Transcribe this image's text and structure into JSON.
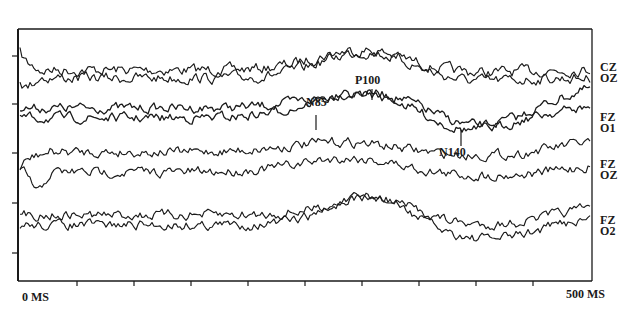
{
  "chart_data": {
    "type": "line",
    "title": "",
    "xlabel": "",
    "ylabel": "",
    "x_range_ms": [
      0,
      500
    ],
    "x_tick_labels": {
      "start": "0 MS",
      "end": "500 MS"
    },
    "x_ticks_ms": [
      0,
      50,
      100,
      150,
      200,
      250,
      300,
      350,
      400,
      450,
      500
    ],
    "y_ticks_count": 5,
    "grid": false,
    "legend_position": "right",
    "pairs": [
      {
        "labels": [
          "CZ",
          "OZ"
        ],
        "baseline_y_px": 70,
        "features": "broad positive hump near ~200-215 ms, otherwise noisy flat"
      },
      {
        "labels": [
          "FZ",
          "O1"
        ],
        "baseline_y_px": 112,
        "features": "negative N85 near 160 ms, positive peak P100 near ~215 ms, negative N140 near ~285 ms",
        "annotations": [
          {
            "text": "N85",
            "x_ms": 157,
            "kind": "negative"
          },
          {
            "text": "P100",
            "x_ms": 215,
            "kind": "positive"
          },
          {
            "text": "N140",
            "x_ms": 288,
            "kind": "negative"
          }
        ]
      },
      {
        "labels": [
          "FZ",
          "OZ"
        ],
        "baseline_y_px": 163,
        "features": "moderate positive bump near ~210 ms, early negative deflection near 15 ms"
      },
      {
        "labels": [
          "FZ",
          "O2"
        ],
        "baseline_y_px": 220,
        "features": "positive peak near ~210 ms, trough near ~290 ms"
      }
    ],
    "annotations": [
      "N85",
      "P100",
      "N140"
    ]
  },
  "labels": {
    "pair1_a": "CZ",
    "pair1_b": "OZ",
    "pair2_a": "FZ",
    "pair2_b": "O1",
    "pair3_a": "FZ",
    "pair3_b": "OZ",
    "pair4_a": "FZ",
    "pair4_b": "O2",
    "n85": "N85",
    "p100": "P100",
    "n140": "N140",
    "x_start": "0 MS",
    "x_end": "500 MS"
  },
  "colors": {
    "ink": "#1a1a1a",
    "background": "#ffffff"
  }
}
